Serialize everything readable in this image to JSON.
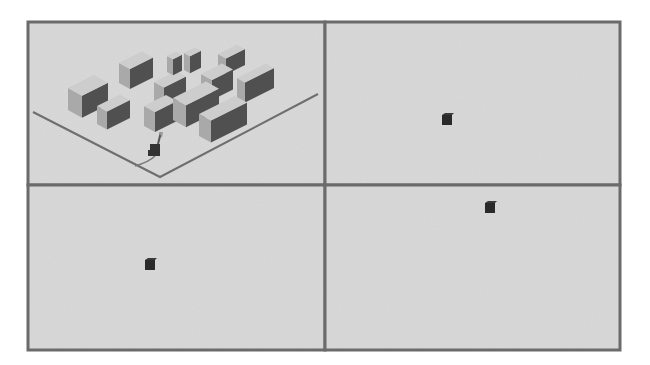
{
  "figure": {
    "layout": "2x2 grid of simulation frames",
    "frame": {
      "x": 28,
      "y": 22,
      "width": 592,
      "height": 328
    },
    "colors": {
      "background": "#d9d9d9",
      "border": "#6b6b6b",
      "floor_line": "#6e6e6e",
      "building_top": "#cdcdcd",
      "building_left": "#a9a9a9",
      "building_right": "#505050",
      "dark_cube": "#2a2a2a"
    }
  },
  "panels": [
    {
      "id": "top-left",
      "x": 28,
      "y": 22,
      "w": 297,
      "h": 163,
      "dx": 0,
      "dy": 0,
      "cube": null,
      "robot": {
        "x": 155,
        "y": 152,
        "pose": "carrying"
      }
    },
    {
      "id": "top-right",
      "x": 325,
      "y": 22,
      "w": 295,
      "h": 163,
      "dx": 294,
      "dy": 2,
      "cube": {
        "x": 447,
        "y": 120
      },
      "robot": {
        "x": 465,
        "y": 147,
        "pose": "reaching"
      }
    },
    {
      "id": "bottom-left",
      "x": 28,
      "y": 185,
      "w": 297,
      "h": 165,
      "dx": 2,
      "dy": 172,
      "cube": {
        "x": 150,
        "y": 265
      },
      "robot": {
        "x": 160,
        "y": 318,
        "pose": "reaching"
      }
    },
    {
      "id": "bottom-right",
      "x": 325,
      "y": 185,
      "w": 295,
      "h": 165,
      "dx": 290,
      "dy": 160,
      "cube": {
        "x": 490,
        "y": 208
      },
      "robot": {
        "x": 457,
        "y": 312,
        "pose": "reaching"
      }
    }
  ],
  "floor": {
    "left_line": [
      [
        33,
        112
      ],
      [
        160,
        177
      ]
    ],
    "right_line": [
      [
        160,
        177
      ],
      [
        318,
        94
      ]
    ]
  },
  "buildings": [
    {
      "x": 68,
      "y": 88,
      "w": 40,
      "d": 14,
      "h": 22
    },
    {
      "x": 97,
      "y": 106,
      "w": 33,
      "d": 10,
      "h": 18
    },
    {
      "x": 119,
      "y": 63,
      "w": 34,
      "d": 11,
      "h": 20
    },
    {
      "x": 154,
      "y": 82,
      "w": 32,
      "d": 10,
      "h": 20
    },
    {
      "x": 167,
      "y": 56,
      "w": 15,
      "d": 6,
      "h": 16
    },
    {
      "x": 184,
      "y": 53,
      "w": 17,
      "d": 6,
      "h": 17
    },
    {
      "x": 218,
      "y": 54,
      "w": 27,
      "d": 8,
      "h": 16
    },
    {
      "x": 201,
      "y": 74,
      "w": 32,
      "d": 11,
      "h": 20
    },
    {
      "x": 237,
      "y": 78,
      "w": 37,
      "d": 8,
      "h": 20
    },
    {
      "x": 144,
      "y": 106,
      "w": 33,
      "d": 11,
      "h": 20
    },
    {
      "x": 173,
      "y": 98,
      "w": 46,
      "d": 13,
      "h": 22
    },
    {
      "x": 199,
      "y": 114,
      "w": 48,
      "d": 12,
      "h": 22
    }
  ]
}
